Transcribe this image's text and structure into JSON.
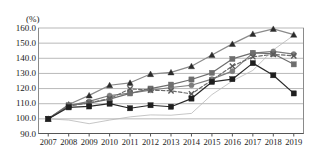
{
  "chart_data": {
    "type": "line",
    "title": "",
    "subtitle": "",
    "unit_label": "(%)",
    "xlabel": "",
    "ylabel": "",
    "grid": true,
    "legend": "none",
    "ylim": [
      90.0,
      160.0
    ],
    "ytick_step": 10.0,
    "yticks": [
      "160.0",
      "150.0",
      "140.0",
      "130.0",
      "120.0",
      "110.0",
      "100.0",
      "90.0"
    ],
    "ytick_values": [
      160.0,
      150.0,
      140.0,
      130.0,
      120.0,
      110.0,
      100.0,
      90.0
    ],
    "categories": [
      "2007",
      "2008",
      "2009",
      "2010",
      "2011",
      "2012",
      "2013",
      "2014",
      "2015",
      "2016",
      "2017",
      "2018",
      "2019"
    ],
    "x": [
      2007,
      2008,
      2009,
      2010,
      2011,
      2012,
      2013,
      2014,
      2015,
      2016,
      2017,
      2018,
      2019
    ],
    "series": [
      {
        "name": "series-1",
        "marker": "triangle",
        "color": "#2b2b2b",
        "line_color": "#8a8a8a",
        "dash": "none",
        "values": [
          100.0,
          109.5,
          115.5,
          122.2,
          123.8,
          129.6,
          130.7,
          134.8,
          142.2,
          149.5,
          156.1,
          159.4,
          155.6
        ]
      },
      {
        "name": "series-2",
        "marker": "circle",
        "color": "#7d7d7d",
        "line_color": "#7d7d7d",
        "dash": "none",
        "values": [
          100.0,
          108.8,
          111.5,
          115.4,
          117.0,
          118.9,
          120.7,
          122.2,
          126.2,
          131.5,
          143.4,
          144.5,
          142.8
        ]
      },
      {
        "name": "series-3",
        "marker": "square",
        "color": "#6e6e6e",
        "line_color": "#6e6e6e",
        "dash": "none",
        "values": [
          100.0,
          109.0,
          110.4,
          113.0,
          116.8,
          120.0,
          122.6,
          126.0,
          130.4,
          139.6,
          143.6,
          143.0,
          136.0
        ]
      },
      {
        "name": "series-4",
        "marker": "x",
        "color": "#5a5a5a",
        "line_color": "#6b6b6b",
        "dash": "dashed",
        "values": [
          100.0,
          108.4,
          110.6,
          113.4,
          119.8,
          119.0,
          118.5,
          116.5,
          125.6,
          134.8,
          141.0,
          142.6,
          141.6
        ]
      },
      {
        "name": "series-5",
        "marker": "square-filled",
        "color": "#1f1f1f",
        "line_color": "#2a2a2a",
        "dash": "none",
        "values": [
          100.0,
          107.6,
          108.2,
          110.0,
          107.0,
          109.0,
          108.0,
          113.4,
          124.4,
          126.2,
          136.8,
          128.8,
          116.8
        ]
      },
      {
        "name": "series-6",
        "marker": "none",
        "color": "#b8b8b8",
        "line_color": "#b8b8b8",
        "dash": "none",
        "values": [
          100.0,
          99.2,
          96.8,
          99.2,
          101.3,
          102.6,
          102.4,
          103.6,
          116.0,
          125.0,
          132.0,
          145.5,
          155.2
        ]
      }
    ]
  }
}
